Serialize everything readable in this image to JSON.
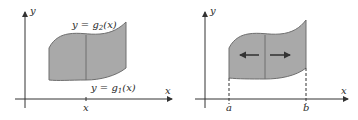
{
  "figure_left": {
    "axis_x_label": "x",
    "axis_y_label": "y",
    "upper_curve_label": "y = g",
    "upper_curve_sub": "2",
    "upper_curve_tail": "(x)",
    "lower_curve_label": "y = g",
    "lower_curve_sub": "1",
    "lower_curve_tail": "(x)",
    "tick_label": "x"
  },
  "figure_right": {
    "axis_x_label": "x",
    "axis_y_label": "y",
    "left_bound_label": "a",
    "right_bound_label": "b"
  },
  "colors": {
    "region_fill": "#a9a9a9",
    "region_stroke": "#6e6e6e",
    "axis": "#333333",
    "text": "#2a2a2a"
  }
}
